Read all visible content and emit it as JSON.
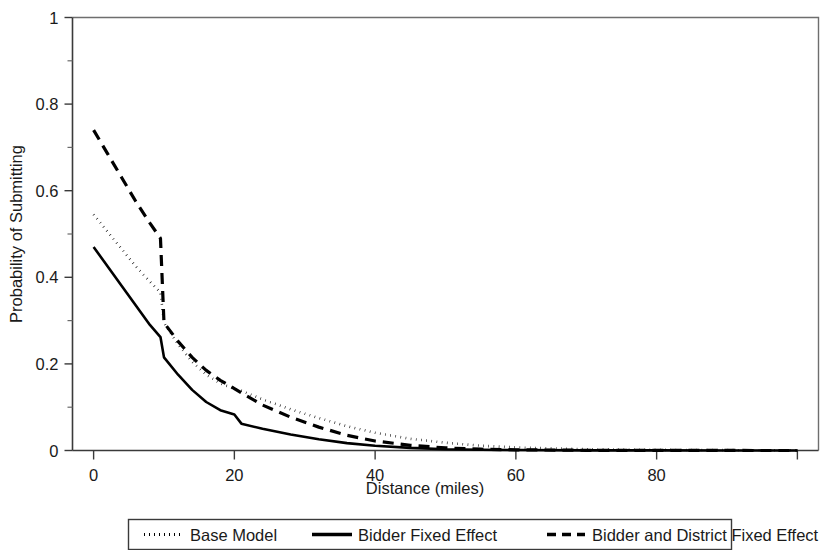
{
  "chart_data": {
    "type": "line",
    "title": "",
    "xlabel": "Distance (miles)",
    "ylabel": "Probability of Submitting",
    "xlim": [
      -3,
      103
    ],
    "ylim": [
      0,
      1
    ],
    "grid": false,
    "legend_position": "bottom",
    "x_ticks": [
      "0",
      "20",
      "40",
      "60",
      "80"
    ],
    "x_tick_values": [
      0,
      20,
      40,
      60,
      80
    ],
    "x_minor_tick_values": [
      100
    ],
    "y_ticks": [
      "0",
      "0.2",
      "0.4",
      "0.6",
      "0.8",
      "1"
    ],
    "y_tick_values": [
      0,
      0.2,
      0.4,
      0.6,
      0.8,
      1
    ],
    "y_minor_tick_values": [
      0.1,
      0.3,
      0.5,
      0.7,
      0.9
    ],
    "x": [
      0,
      2,
      4,
      6,
      8,
      9.5,
      10,
      12,
      14,
      16,
      18,
      20,
      21,
      24,
      28,
      32,
      36,
      40,
      45,
      50,
      55,
      60,
      70,
      80,
      90,
      100
    ],
    "series": [
      {
        "name": "Base Model",
        "style": "dotted",
        "values": [
          0.545,
          0.505,
          0.465,
          0.425,
          0.39,
          0.365,
          0.295,
          0.245,
          0.205,
          0.175,
          0.155,
          0.142,
          0.138,
          0.118,
          0.095,
          0.075,
          0.056,
          0.041,
          0.027,
          0.018,
          0.011,
          0.007,
          0.003,
          0.0015,
          0.0008,
          0.0004
        ]
      },
      {
        "name": "Bidder Fixed Effect",
        "style": "solid",
        "values": [
          0.47,
          0.425,
          0.38,
          0.335,
          0.29,
          0.262,
          0.215,
          0.175,
          0.14,
          0.112,
          0.093,
          0.083,
          0.062,
          0.05,
          0.037,
          0.026,
          0.017,
          0.011,
          0.006,
          0.003,
          0.0018,
          0.001,
          0.0004,
          0.0002,
          0.0001,
          0.0
        ]
      },
      {
        "name": "Bidder and District Fixed Effect",
        "style": "dashed",
        "values": [
          0.74,
          0.685,
          0.63,
          0.575,
          0.525,
          0.49,
          0.295,
          0.252,
          0.215,
          0.185,
          0.162,
          0.143,
          0.133,
          0.105,
          0.077,
          0.054,
          0.035,
          0.022,
          0.012,
          0.006,
          0.003,
          0.0016,
          0.0005,
          0.0002,
          0.0001,
          0.0
        ]
      }
    ]
  },
  "legend": {
    "items": [
      {
        "label": "Base Model",
        "style": "dotted"
      },
      {
        "label": "Bidder Fixed Effect",
        "style": "solid"
      },
      {
        "label": "Bidder and District Fixed Effect",
        "style": "dashed"
      }
    ]
  }
}
